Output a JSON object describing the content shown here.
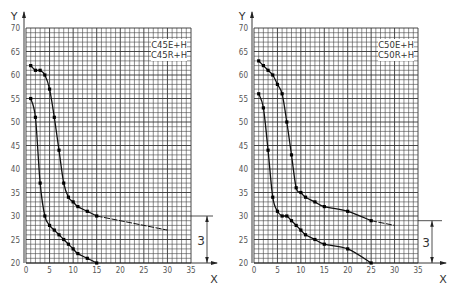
{
  "chart_data": [
    {
      "type": "line",
      "title": "",
      "xlabel": "X",
      "ylabel": "Y",
      "xlim": [
        0,
        35
      ],
      "ylim": [
        20,
        70
      ],
      "x_ticks": [
        "0",
        "5",
        "10",
        "15",
        "20",
        "25",
        "30",
        "35"
      ],
      "y_ticks": [
        "20",
        "25",
        "30",
        "35",
        "40",
        "45",
        "50",
        "55",
        "60",
        "65",
        "70"
      ],
      "grid": true,
      "legend_position": "top-right",
      "legend": [
        "C45E+H",
        "C45R+H"
      ],
      "dimension": {
        "label": "3",
        "from_y": 30,
        "to_y": 20
      },
      "series": [
        {
          "name": "C45E+H",
          "points": [
            [
              1,
              62
            ],
            [
              2,
              61
            ],
            [
              3,
              61
            ],
            [
              4,
              60
            ],
            [
              5,
              57
            ],
            [
              6,
              51
            ],
            [
              7,
              44
            ],
            [
              8,
              37
            ],
            [
              9,
              34
            ],
            [
              10,
              33
            ],
            [
              11,
              32
            ],
            [
              13,
              31
            ],
            [
              15,
              30
            ]
          ],
          "tail": [
            [
              15,
              30
            ],
            [
              20,
              29
            ],
            [
              25,
              28
            ],
            [
              30,
              27
            ]
          ]
        },
        {
          "name": "C45R+H",
          "points": [
            [
              1,
              55
            ],
            [
              2,
              51
            ],
            [
              3,
              37
            ],
            [
              4,
              30
            ],
            [
              5,
              28
            ],
            [
              6,
              27
            ],
            [
              7,
              26
            ],
            [
              8,
              25
            ],
            [
              9,
              24
            ],
            [
              10,
              23
            ],
            [
              11,
              22
            ],
            [
              13,
              21
            ],
            [
              15,
              20
            ]
          ],
          "tail": []
        }
      ]
    },
    {
      "type": "line",
      "title": "",
      "xlabel": "X",
      "ylabel": "Y",
      "xlim": [
        0,
        35
      ],
      "ylim": [
        20,
        70
      ],
      "x_ticks": [
        "0",
        "5",
        "10",
        "15",
        "20",
        "25",
        "30",
        "35"
      ],
      "y_ticks": [
        "20",
        "25",
        "30",
        "35",
        "40",
        "45",
        "50",
        "55",
        "60",
        "65",
        "70"
      ],
      "grid": true,
      "legend_position": "top-right",
      "legend": [
        "C50E+H",
        "C50R+H"
      ],
      "dimension": {
        "label": "3",
        "from_y": 29,
        "to_y": 20
      },
      "series": [
        {
          "name": "C50E+H",
          "points": [
            [
              1,
              63
            ],
            [
              2,
              62
            ],
            [
              3,
              61
            ],
            [
              4,
              60
            ],
            [
              5,
              58
            ],
            [
              6,
              56
            ],
            [
              7,
              50
            ],
            [
              8,
              43
            ],
            [
              9,
              36
            ],
            [
              10,
              35
            ],
            [
              11,
              34
            ],
            [
              13,
              33
            ],
            [
              15,
              32
            ],
            [
              20,
              31
            ],
            [
              25,
              29
            ]
          ],
          "tail": [
            [
              25,
              29
            ],
            [
              30,
              28
            ]
          ]
        },
        {
          "name": "C50R+H",
          "points": [
            [
              1,
              56
            ],
            [
              2,
              53
            ],
            [
              3,
              44
            ],
            [
              4,
              34
            ],
            [
              5,
              31
            ],
            [
              6,
              30
            ],
            [
              7,
              30
            ],
            [
              8,
              29
            ],
            [
              9,
              28
            ],
            [
              10,
              27
            ],
            [
              11,
              26
            ],
            [
              13,
              25
            ],
            [
              15,
              24
            ],
            [
              20,
              23
            ],
            [
              25,
              20
            ]
          ],
          "tail": []
        }
      ]
    }
  ]
}
